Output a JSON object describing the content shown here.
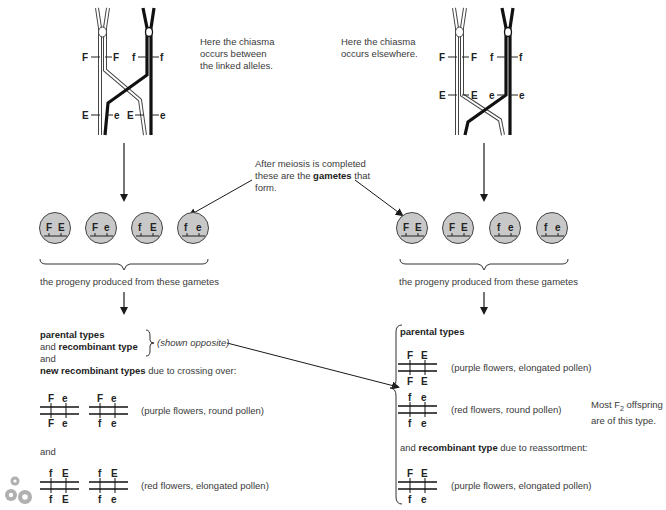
{
  "left_panel": {
    "chromosome_labels_top": [
      "F",
      "F",
      "f",
      "f"
    ],
    "chromosome_labels_bottom": [
      "E",
      "e",
      "E",
      "e"
    ],
    "caption": [
      "Here the chiasma",
      "occurs between",
      "the linked alleles."
    ],
    "gametes": [
      {
        "allele1": "F",
        "allele2": "E"
      },
      {
        "allele1": "F",
        "allele2": "e"
      },
      {
        "allele1": "f",
        "allele2": "E"
      },
      {
        "allele1": "f",
        "allele2": "e"
      }
    ],
    "progeny_text": "the progeny produced from these gametes",
    "summary": {
      "line1_bold": "parental types",
      "line2_prefix": "and ",
      "line2_bold": "recombinant type",
      "shown_opposite": "(shown opposite)",
      "line3": "and",
      "line4_bold": "new recombinant types",
      "line4_suffix": " due to crossing over:"
    },
    "genotypes_group1": [
      {
        "top": [
          "F",
          "e"
        ],
        "bottom": [
          "F",
          "e"
        ]
      },
      {
        "top": [
          "F",
          "e"
        ],
        "bottom": [
          "f",
          "e"
        ]
      }
    ],
    "phenotype1": "(purple flowers, round pollen)",
    "and_label": "and",
    "genotypes_group2": [
      {
        "top": [
          "f",
          "E"
        ],
        "bottom": [
          "f",
          "E"
        ]
      },
      {
        "top": [
          "f",
          "E"
        ],
        "bottom": [
          "f",
          "e"
        ]
      }
    ],
    "phenotype2": "(red flowers, elongated pollen)"
  },
  "right_panel": {
    "chromosome_labels_top": [
      "F",
      "F",
      "f",
      "f"
    ],
    "chromosome_labels_bottom": [
      "E",
      "E",
      "e",
      "e"
    ],
    "caption": [
      "Here the chiasma",
      "occurs elsewhere."
    ],
    "gametes": [
      {
        "allele1": "F",
        "allele2": "E"
      },
      {
        "allele1": "F",
        "allele2": "E"
      },
      {
        "allele1": "f",
        "allele2": "e"
      },
      {
        "allele1": "f",
        "allele2": "e"
      }
    ],
    "progeny_text": "the progeny produced from these gametes",
    "parental_heading": "parental types",
    "parental": [
      {
        "top": [
          "F",
          "E"
        ],
        "bottom": [
          "F",
          "E"
        ],
        "phenotype": "(purple flowers, elongated pollen)"
      },
      {
        "top": [
          "f",
          "e"
        ],
        "bottom": [
          "f",
          "e"
        ],
        "phenotype": "(red flowers, round pollen)"
      }
    ],
    "note_line1_prefix": "Most F",
    "note_sub": "2",
    "note_line1_suffix": " offspring",
    "note_line2": "are of this type.",
    "recomb_prefix": "and ",
    "recomb_bold": "recombinant type",
    "recomb_suffix": " due to reassortment:",
    "recombinant": {
      "top": [
        "F",
        "E"
      ],
      "bottom": [
        "f",
        "e"
      ],
      "phenotype": "(purple flowers, elongated pollen)"
    }
  },
  "center_note": {
    "line1": "After meiosis is completed",
    "line2_prefix": "these are the ",
    "line2_bold": "gametes",
    "line2_suffix": " that",
    "line3": "form."
  },
  "colors": {
    "gamete_fill": "#c8c8c8",
    "line": "#1a1a1a",
    "text": "#3a3a3a"
  }
}
